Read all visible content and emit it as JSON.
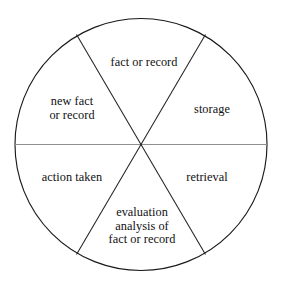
{
  "diagram": {
    "type": "pie-wheel",
    "title": "",
    "shape": "circle divided into six sectors",
    "stroke_color": "#1a1a1a",
    "diameter_line_color": "#8a8a8a",
    "background_color": "#ffffff",
    "text_color": "#111111",
    "sectors": [
      {
        "id": "fact-or-record",
        "position": "top",
        "label": "fact or record"
      },
      {
        "id": "storage",
        "position": "upper-right",
        "label": "storage"
      },
      {
        "id": "retrieval",
        "position": "lower-right",
        "label": "retrieval"
      },
      {
        "id": "evaluation-analysis",
        "position": "bottom",
        "label": "evaluation\nanalysis of\nfact or record"
      },
      {
        "id": "action-taken",
        "position": "lower-left",
        "label": "action taken"
      },
      {
        "id": "new-fact-or-record",
        "position": "upper-left",
        "label": "new fact\nor record"
      }
    ]
  }
}
